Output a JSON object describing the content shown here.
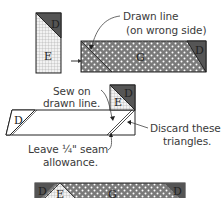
{
  "diagram": {
    "step1": {
      "piece_small_labels": [
        "D",
        "E"
      ],
      "strip_labels": [
        "G",
        "D"
      ],
      "callout": [
        "Drawn line",
        "(on wrong side)"
      ]
    },
    "step2": {
      "piece_labels": [
        "D",
        "E",
        "D"
      ],
      "callout_sew": [
        "Sew on",
        "drawn line."
      ],
      "callout_seam": [
        "Leave ¼\" seam",
        "allowance."
      ],
      "callout_discard": [
        "Discard these",
        "triangles."
      ]
    },
    "step3": {
      "strip_labels": [
        "D",
        "E",
        "G",
        "D"
      ]
    },
    "colors": {
      "dark": "#555555",
      "dot_fabric": "#7a7a7a",
      "grid_fabric": "#e8e8e8",
      "outline": "#222222",
      "text": "#3a3a3a"
    }
  }
}
